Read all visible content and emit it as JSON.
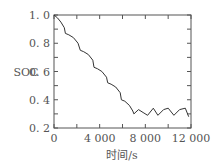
{
  "chart_data": {
    "type": "line",
    "title": "",
    "xlabel": "时间/s",
    "ylabel": "SOC",
    "xlim": [
      0,
      12000
    ],
    "ylim": [
      0.2,
      1.0
    ],
    "xticks": [
      "0",
      "4 000",
      "8 000",
      "12 000"
    ],
    "yticks": [
      "0.2",
      "0.4",
      "0.6",
      "0.8",
      "1.0"
    ],
    "grid": false,
    "legend": null,
    "series": [
      {
        "name": "SOC",
        "x": [
          0,
          300,
          600,
          900,
          1000,
          1300,
          1700,
          2100,
          2300,
          2600,
          3000,
          3400,
          3500,
          3800,
          4200,
          4600,
          4700,
          5000,
          5400,
          5800,
          5900,
          6200,
          6600,
          6900,
          7000,
          7400,
          7800,
          8200,
          8700,
          9100,
          9600,
          10000,
          10500,
          11000,
          11500,
          11800
        ],
        "y": [
          1.0,
          0.98,
          0.95,
          0.91,
          0.87,
          0.86,
          0.84,
          0.8,
          0.75,
          0.74,
          0.72,
          0.68,
          0.63,
          0.62,
          0.6,
          0.56,
          0.52,
          0.51,
          0.49,
          0.45,
          0.4,
          0.39,
          0.36,
          0.32,
          0.3,
          0.33,
          0.31,
          0.29,
          0.34,
          0.29,
          0.33,
          0.34,
          0.29,
          0.33,
          0.34,
          0.28
        ]
      }
    ]
  }
}
